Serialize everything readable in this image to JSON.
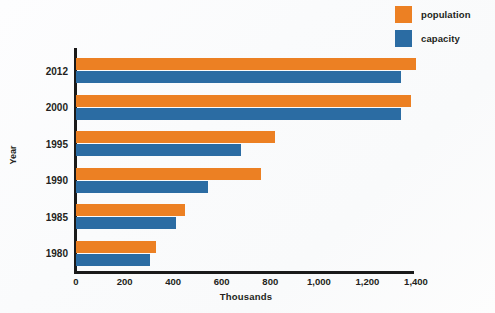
{
  "chart_data": {
    "type": "bar",
    "orientation": "horizontal",
    "title": "",
    "xlabel": "Thousands",
    "ylabel": "Year",
    "categories": [
      "2012",
      "2000",
      "1995",
      "1990",
      "1985",
      "1980"
    ],
    "series": [
      {
        "name": "population",
        "color": "#ec8023",
        "values": [
          1400,
          1380,
          820,
          760,
          450,
          330
        ]
      },
      {
        "name": "capacity",
        "color": "#2b6ca3",
        "values": [
          1340,
          1340,
          680,
          545,
          410,
          305
        ]
      }
    ],
    "xticks": [
      "0",
      "200",
      "400",
      "600",
      "800",
      "1,000",
      "1,200",
      "1,400"
    ],
    "xtick_values": [
      0,
      200,
      400,
      600,
      800,
      1000,
      1200,
      1400
    ],
    "xlim": [
      0,
      1400
    ],
    "grid": false,
    "legend": {
      "position": "top-right",
      "entries": [
        {
          "label": "population",
          "color": "#ec8023"
        },
        {
          "label": "capacity",
          "color": "#2b6ca3"
        }
      ]
    }
  },
  "colors": {
    "population": "#ec8023",
    "capacity": "#2b6ca3",
    "axis": "#1a1a1a",
    "text": "#231f20",
    "background": "#fbfcfd"
  }
}
